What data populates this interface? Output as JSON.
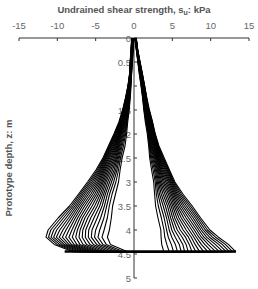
{
  "chart_data": {
    "type": "line",
    "title": "",
    "xlabel": "Undrained shear strength, s_u: kPa",
    "xlabel_main": "Undrained shear strength, s",
    "xlabel_sub": "u",
    "xlabel_tail": ": kPa",
    "ylabel": "Prototype depth, z: m",
    "xlim": [
      -15,
      15
    ],
    "ylim": [
      0,
      5
    ],
    "y_inverted": true,
    "x_axis_position": "top",
    "xticks": [
      -15,
      -10,
      -5,
      0,
      5,
      10,
      15
    ],
    "yticks": [
      0,
      0.5,
      1,
      1.5,
      2,
      2.5,
      3,
      3.5,
      4,
      4.5,
      5
    ],
    "ytick_labels": [
      "0",
      "0.5",
      "1",
      "1.5",
      "2",
      "2.5",
      "3",
      "3.5",
      "4",
      "4.5",
      "5"
    ],
    "grid": false,
    "legend": null,
    "num_profiles": 20,
    "spike_depth": 4.45,
    "depth_samples": [
      0,
      0.25,
      0.5,
      0.75,
      1.0,
      1.25,
      1.5,
      1.75,
      2.0,
      2.25,
      2.5,
      2.75,
      3.0,
      3.25,
      3.5,
      3.75,
      4.0,
      4.15,
      4.3,
      4.45
    ],
    "left_outer_envelope": [
      -0.3,
      -0.4,
      -0.5,
      -0.6,
      -0.8,
      -1.1,
      -1.5,
      -2.0,
      -2.6,
      -3.3,
      -4.1,
      -5.0,
      -6.0,
      -7.2,
      -8.5,
      -9.9,
      -11.1,
      -11.5,
      -10.5,
      -8.0
    ],
    "left_inner_envelope": [
      0.0,
      -0.1,
      -0.2,
      -0.3,
      -0.4,
      -0.5,
      -0.6,
      -0.8,
      -1.0,
      -1.2,
      -1.5,
      -1.8,
      -2.1,
      -2.4,
      -2.7,
      -3.0,
      -3.3,
      -3.4,
      -3.0,
      -1.0
    ],
    "right_outer_envelope": [
      0.3,
      0.5,
      0.8,
      1.1,
      1.4,
      1.7,
      2.0,
      2.4,
      2.8,
      3.3,
      3.9,
      4.6,
      5.4,
      6.4,
      7.5,
      8.7,
      10.0,
      11.0,
      12.2,
      13.3
    ],
    "right_inner_envelope": [
      0.1,
      0.3,
      0.5,
      0.7,
      0.9,
      1.1,
      1.3,
      1.5,
      1.7,
      1.9,
      2.1,
      2.3,
      2.5,
      2.7,
      2.9,
      3.1,
      3.4,
      3.6,
      3.7,
      3.8
    ],
    "series_color": "#000000"
  },
  "axes": {
    "line_color": "#333333",
    "label_color": "#555555",
    "tick_color": "#666666"
  }
}
